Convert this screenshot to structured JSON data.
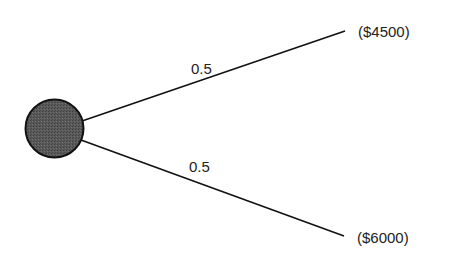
{
  "diagram": {
    "type": "decision-tree-chance-node",
    "node": {
      "kind": "chance",
      "shape": "circle",
      "fill": "#555555",
      "stroke": "#111111"
    },
    "branches": [
      {
        "probability": "0.5",
        "outcome": "($4500)"
      },
      {
        "probability": "0.5",
        "outcome": "($6000)"
      }
    ],
    "colors": {
      "line": "#111111",
      "text": "#222222",
      "background": "#ffffff"
    }
  }
}
